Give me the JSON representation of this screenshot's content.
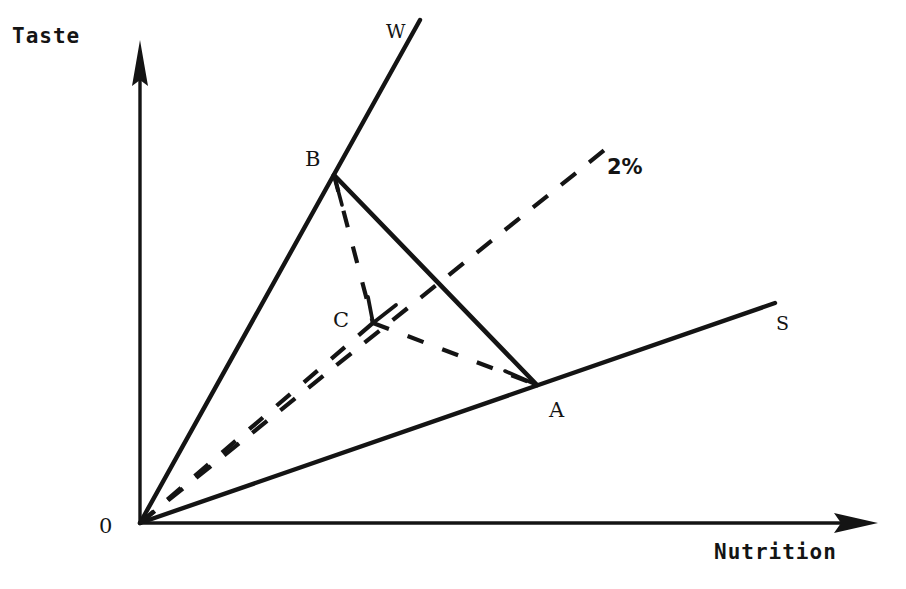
{
  "figure": {
    "kind": "line-diagram",
    "background_color": "#ffffff",
    "ink_color": "#141414",
    "width": 906,
    "height": 589
  },
  "axes": {
    "y": {
      "title": "Taste",
      "title_x": 12,
      "title_y": 26,
      "from": [
        140,
        523
      ],
      "to": [
        140,
        42
      ],
      "arrow": true
    },
    "x": {
      "title": "Nutrition",
      "title_x": 714,
      "title_y": 542,
      "from": [
        140,
        523
      ],
      "to": [
        876,
        523
      ],
      "arrow": true
    },
    "origin": {
      "label": "0",
      "label_x": 99,
      "label_y": 516,
      "point": [
        140,
        523
      ]
    }
  },
  "rays": [
    {
      "name": "wine-ray",
      "label": "W",
      "label_x": 386,
      "label_y": 22,
      "style": "solid",
      "from": [
        140,
        523
      ],
      "to": [
        420,
        20
      ]
    },
    {
      "name": "two-percent-ray",
      "label": "2%",
      "label_x": 607,
      "label_y": 157,
      "style": "dashed",
      "from": [
        140,
        523
      ],
      "to": [
        617,
        140
      ]
    },
    {
      "name": "staple-ray",
      "label": "S",
      "label_x": 776,
      "label_y": 314,
      "style": "solid",
      "from": [
        140,
        523
      ],
      "to": [
        775,
        303
      ]
    }
  ],
  "vertices": [
    {
      "name": "point-b",
      "label": "B",
      "x": 334,
      "y": 175,
      "label_x": 305,
      "label_y": 149
    },
    {
      "name": "point-a",
      "label": "A",
      "x": 537,
      "y": 385,
      "label_x": 549,
      "label_y": 400
    },
    {
      "name": "point-c",
      "label": "C",
      "x": 373,
      "y": 323,
      "label_x": 333,
      "label_y": 310
    }
  ],
  "segments": [
    {
      "name": "segment-b-a",
      "style": "solid",
      "from": [
        334,
        175
      ],
      "to": [
        537,
        385
      ]
    },
    {
      "name": "segment-b-c",
      "style": "dashed",
      "from": [
        334,
        175
      ],
      "to": [
        373,
        323
      ]
    },
    {
      "name": "segment-c-a",
      "style": "dashed",
      "from": [
        373,
        323
      ],
      "to": [
        537,
        385
      ]
    },
    {
      "name": "segment-o-c",
      "style": "dashed",
      "from": [
        140,
        523
      ],
      "to": [
        373,
        323
      ]
    }
  ],
  "chart_data": {
    "type": "scatter",
    "title": "",
    "xlabel": "Nutrition",
    "ylabel": "Taste",
    "annotations": [
      "0",
      "W",
      "S",
      "B",
      "A",
      "C",
      "2%"
    ],
    "series": [
      {
        "name": "W ray (wine / high-taste budget line)",
        "style": "solid",
        "points": [
          [
            140,
            523
          ],
          [
            420,
            20
          ]
        ]
      },
      {
        "name": "S ray (staple / high-nutrition budget line)",
        "style": "solid",
        "points": [
          [
            140,
            523
          ],
          [
            775,
            303
          ]
        ]
      },
      {
        "name": "2% ray (expansion path through C)",
        "style": "dashed",
        "points": [
          [
            140,
            523
          ],
          [
            617,
            140
          ]
        ]
      },
      {
        "name": "B-A frontier",
        "style": "solid",
        "points": [
          [
            334,
            175
          ],
          [
            537,
            385
          ]
        ]
      },
      {
        "name": "C connectors",
        "style": "dashed",
        "points": [
          [
            334,
            175
          ],
          [
            373,
            323
          ],
          [
            537,
            385
          ]
        ]
      }
    ]
  }
}
